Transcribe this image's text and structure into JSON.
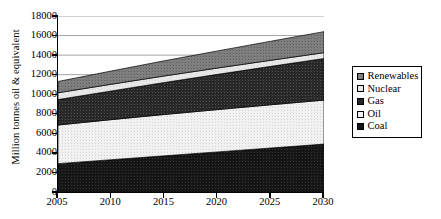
{
  "chart_data": {
    "type": "area",
    "stacked": true,
    "title": "",
    "xlabel": "",
    "ylabel": "Million tonnes oil & equivalent",
    "x": [
      2005,
      2010,
      2015,
      2020,
      2025,
      2030
    ],
    "xlim": [
      2005,
      2030
    ],
    "ylim": [
      0,
      18000
    ],
    "ytick_labels": [
      "0",
      "2000",
      "4000",
      "6000",
      "8000",
      "10000",
      "12000",
      "14000",
      "16000",
      "18000"
    ],
    "ytick_values": [
      0,
      2000,
      4000,
      6000,
      8000,
      10000,
      12000,
      14000,
      16000,
      18000
    ],
    "xtick_labels": [
      "2005",
      "2010",
      "2015",
      "2020",
      "2025",
      "2030"
    ],
    "grid": true,
    "grid_axis": "y",
    "legend_position": "right",
    "stack_order_bottom_to_top": [
      "Coal",
      "Oil",
      "Gas",
      "Nuclear",
      "Renewables"
    ],
    "series": [
      {
        "name": "Coal",
        "values": [
          2900,
          3300,
          3700,
          4100,
          4500,
          4900
        ]
      },
      {
        "name": "Oil",
        "values": [
          3950,
          4100,
          4230,
          4330,
          4420,
          4500
        ]
      },
      {
        "name": "Gas",
        "values": [
          2600,
          2930,
          3270,
          3600,
          3930,
          4250
        ]
      },
      {
        "name": "Nuclear",
        "values": [
          700,
          690,
          670,
          650,
          620,
          600
        ]
      },
      {
        "name": "Renewables",
        "values": [
          1150,
          1350,
          1550,
          1750,
          1950,
          2150
        ]
      }
    ],
    "cumulative_totals": [
      11300,
      12370,
      13420,
      14430,
      15420,
      16400
    ]
  },
  "legend": {
    "items": [
      {
        "label": "Renewables",
        "fill": "#808080"
      },
      {
        "label": "Nuclear",
        "fill": "#e8e8e8"
      },
      {
        "label": "Gas",
        "fill": "#262626"
      },
      {
        "label": "Oil",
        "fill": "#f2f2f2"
      },
      {
        "label": "Coal",
        "fill": "#141414"
      }
    ]
  },
  "colors": {
    "renewables": "#808080",
    "nuclear": "#e8e8e8",
    "gas": "#262626",
    "oil": "#f2f2f2",
    "coal": "#141414",
    "axis": "#000000",
    "grid": "#9a9a9a",
    "background": "#ffffff"
  }
}
